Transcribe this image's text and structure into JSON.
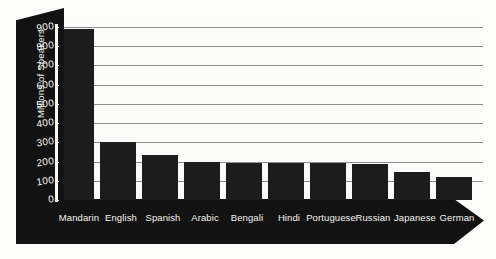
{
  "chart_data": {
    "type": "bar",
    "title": "",
    "subtitle": "",
    "xlabel": "",
    "ylabel": "Millions of Speakers",
    "ylim": [
      0,
      900
    ],
    "ytick_step": 100,
    "yticks": [
      "0",
      "100",
      "200",
      "300",
      "400",
      "500",
      "600",
      "700",
      "800",
      "900"
    ],
    "grid": true,
    "legend": "none",
    "orientation": "vertical",
    "categories": [
      "Mandarin",
      "English",
      "Spanish",
      "Arabic",
      "Bengali",
      "Hindi",
      "Portuguese",
      "Russian",
      "Japanese",
      "German"
    ],
    "values": [
      890,
      300,
      235,
      200,
      190,
      192,
      192,
      187,
      145,
      120
    ],
    "series": [
      {
        "name": "Millions of Speakers",
        "values": [
          890,
          300,
          235,
          200,
          190,
          192,
          192,
          187,
          145,
          120
        ]
      }
    ]
  },
  "style": {
    "bar_color": "#1c1c1c",
    "axis_slab_color": "#121212",
    "grid_color": "#8d8d8d",
    "background_color": "#fbfbf9",
    "axis_text_color": "#f4f4ef"
  }
}
